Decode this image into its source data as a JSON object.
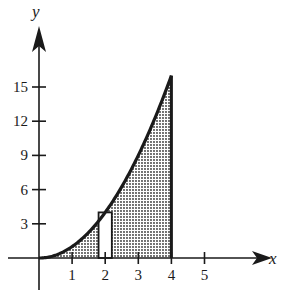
{
  "chart_data": {
    "type": "area",
    "title": "",
    "xlabel": "x",
    "ylabel": "y",
    "function": "y = x^2",
    "x_ticks": [
      1,
      2,
      3,
      4,
      5
    ],
    "y_ticks": [
      3,
      6,
      9,
      12,
      15
    ],
    "xlim": [
      0,
      5.5
    ],
    "ylim": [
      0,
      17
    ],
    "curve": {
      "x": [
        0,
        0.5,
        1,
        1.5,
        2,
        2.5,
        3,
        3.5,
        4
      ],
      "y": [
        0,
        0.25,
        1,
        2.25,
        4,
        6.25,
        9,
        12.25,
        16
      ]
    },
    "shaded_region": {
      "from_x": 0,
      "to_x": 4,
      "fill": "dotted"
    },
    "rectangle": {
      "x_center": 2,
      "width": 0.4,
      "height": 4,
      "fill": "white"
    },
    "grid": false,
    "legend": null
  },
  "labels": {
    "x_axis": "x",
    "y_axis": "y",
    "x_tick_labels": [
      "1",
      "2",
      "3",
      "4",
      "5"
    ],
    "y_tick_labels": [
      "3",
      "6",
      "9",
      "12",
      "15"
    ]
  }
}
